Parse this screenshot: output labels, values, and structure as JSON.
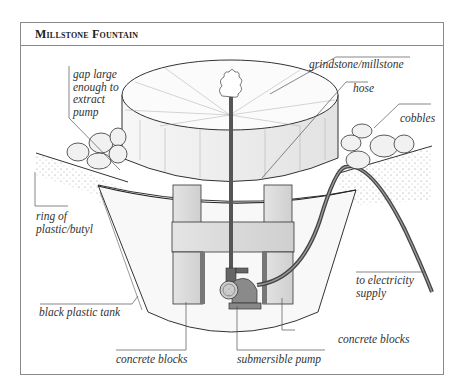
{
  "figure": {
    "title": "Millstone Fountain",
    "labels": {
      "gap": [
        "gap large",
        "enough to",
        "extract",
        "pump"
      ],
      "grindstone": "grindstone/millstone",
      "hose": "hose",
      "cobbles": "cobbles",
      "ring": [
        "ring of",
        "plastic/butyl"
      ],
      "electricity": [
        "to electricity",
        "supply"
      ],
      "tank": "black plastic tank",
      "blocks_left": "concrete blocks",
      "pump": "submersible pump",
      "blocks_right": "concrete blocks"
    },
    "colors": {
      "frame": "#8a8a8a",
      "ink": "#333333",
      "hose": "#555555",
      "stone": "#f4f4f4"
    }
  }
}
